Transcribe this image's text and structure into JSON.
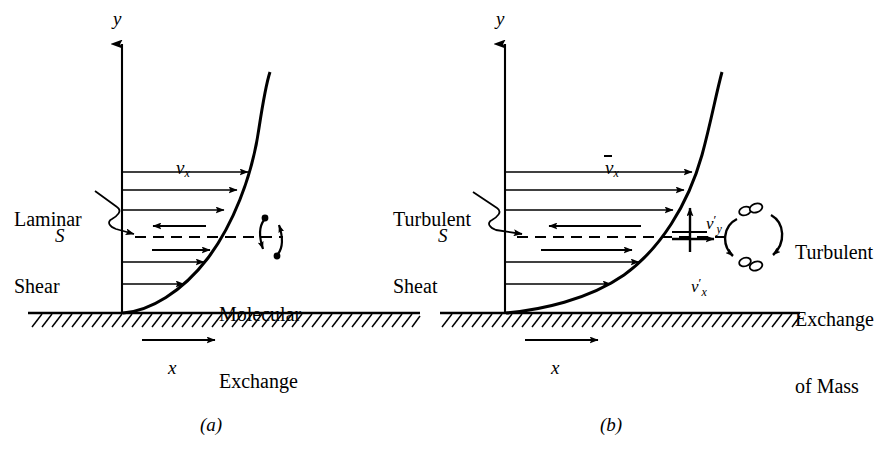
{
  "figure": {
    "type": "diagram",
    "panels": [
      {
        "id": "a",
        "caption": "(a)",
        "caption_x": 200,
        "caption_y": 428,
        "regime": "laminar",
        "axis_y_label": "y",
        "axis_x_label": "x",
        "velocity_label": "v",
        "velocity_sub": "x",
        "velocity_overbar": false,
        "surface_label": "S",
        "callout_label": "Laminar\nShear",
        "callout_line1": "Laminar",
        "callout_line2": "Shear",
        "exchange_label": "Molecular\nExchange",
        "exchange_line1": "Molecular",
        "exchange_line2": "Exchange",
        "origin": {
          "x": 122,
          "y": 313
        },
        "axis_top_y": 40,
        "ground_y": 313,
        "ground_x0": 28,
        "ground_x1": 420,
        "profile_top": {
          "x": 270,
          "y": 72
        },
        "profile_exponent": 2.0,
        "s_line_y": 237,
        "arrow_rows": [
          {
            "y": 172,
            "tip_x": 248
          },
          {
            "y": 190,
            "tip_x": 237
          },
          {
            "y": 210,
            "tip_x": 224
          },
          {
            "y": 262,
            "tip_x": 204
          },
          {
            "y": 284,
            "tip_x": 184
          }
        ],
        "shear_arrows": [
          {
            "y": 225,
            "x1": 206,
            "x2": 152,
            "dir": "left"
          },
          {
            "y": 250,
            "x1": 152,
            "x2": 212,
            "dir": "right"
          }
        ]
      },
      {
        "id": "b",
        "caption": "(b)",
        "caption_x": 600,
        "caption_y": 428,
        "regime": "turbulent",
        "axis_y_label": "y",
        "axis_x_label": "x",
        "velocity_label": "v",
        "velocity_sub": "x",
        "velocity_overbar": true,
        "surface_label": "S",
        "callout_label": "Turbulent\nSheat",
        "callout_line1": "Turbulent",
        "callout_line2": "Sheat",
        "exchange_label": "Turbulent\nExchange\nof Mass",
        "exchange_line1": "Turbulent",
        "exchange_line2": "Exchange",
        "exchange_line3": "of Mass",
        "fluct_y_label": "v",
        "fluct_y_sub": "y",
        "fluct_x_label": "v",
        "fluct_x_sub": "x",
        "fluct_prime": "′",
        "origin": {
          "x": 505,
          "y": 313
        },
        "axis_top_y": 40,
        "ground_y": 313,
        "ground_x0": 440,
        "ground_x1": 800,
        "profile_top": {
          "x": 722,
          "y": 72
        },
        "profile_exponent": 2.4,
        "s_line_y": 237,
        "arrow_rows": [
          {
            "y": 172,
            "tip_x": 690
          },
          {
            "y": 190,
            "tip_x": 683
          },
          {
            "y": 210,
            "tip_x": 672
          },
          {
            "y": 262,
            "tip_x": 638
          },
          {
            "y": 284,
            "tip_x": 610
          }
        ],
        "shear_arrows": [
          {
            "y": 225,
            "x1": 640,
            "x2": 548,
            "dir": "left"
          },
          {
            "y": 250,
            "x1": 540,
            "x2": 634,
            "dir": "right"
          }
        ]
      }
    ],
    "colors": {
      "ink": "#000000",
      "background": "#ffffff"
    }
  }
}
